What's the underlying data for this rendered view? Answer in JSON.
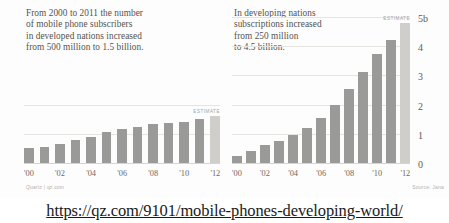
{
  "url": {
    "text": "https://qz.com/9101/mobile-phones-developing-world/"
  },
  "panels": {
    "left": {
      "blurb": "From 2000 to 2011 the number\nof mobile phone subscribers\nin developed nations increased\nfrom 500 million to 1.5 billion.",
      "estimate_label": "ESTIMATE",
      "credit": "Quartz | qz.com"
    },
    "right": {
      "blurb": "In developing nations\nsubscriptions increased\nfrom 250 million\nto 4.5 billion.",
      "estimate_label": "ESTIMATE",
      "credit": "Source: Jana"
    }
  },
  "colors": {
    "bar": "#9a9a98",
    "bar_estimate": "#cfcecb",
    "gridline": "#e6e4e1",
    "text": "#55524e"
  },
  "chart_data": [
    {
      "type": "bar",
      "title": "From 2000 to 2011 the number of mobile phone subscribers in developed nations increased from 500 million to 1.5 billion.",
      "xlabel": "",
      "ylabel": "",
      "categories": [
        "'00",
        "'01",
        "'02",
        "'03",
        "'04",
        "'05",
        "'06",
        "'07",
        "'08",
        "'09",
        "'10",
        "'11",
        "'12"
      ],
      "tick_labels": [
        "'00",
        "",
        "'02",
        "",
        "'04",
        "",
        "'06",
        "",
        "'08",
        "",
        "'10",
        "",
        "'12"
      ],
      "values": [
        0.5,
        0.55,
        0.65,
        0.8,
        0.88,
        1.05,
        1.15,
        1.25,
        1.33,
        1.38,
        1.42,
        1.5,
        1.6
      ],
      "ylim": [
        0,
        5
      ],
      "gridlines": [
        1,
        2
      ],
      "estimate_index": 12,
      "grid": true,
      "legend": "none",
      "units": "billions of subscribers"
    },
    {
      "type": "bar",
      "title": "In developing nations subscriptions increased from 250 million to 4.5 billion.",
      "xlabel": "",
      "ylabel": "",
      "categories": [
        "'00",
        "'01",
        "'02",
        "'03",
        "'04",
        "'05",
        "'06",
        "'07",
        "'08",
        "'09",
        "'10",
        "'11",
        "'12"
      ],
      "tick_labels": [
        "'00",
        "",
        "'02",
        "",
        "'04",
        "",
        "'06",
        "",
        "'08",
        "",
        "'10",
        "",
        "'12"
      ],
      "values": [
        0.25,
        0.4,
        0.6,
        0.75,
        0.95,
        1.2,
        1.55,
        2.0,
        2.55,
        3.1,
        3.75,
        4.2,
        4.8
      ],
      "ylim": [
        0,
        5
      ],
      "ytick_labels": [
        "5b",
        "4",
        "3",
        "2",
        "1",
        "0"
      ],
      "ytick_values": [
        5,
        4,
        3,
        2,
        1,
        0
      ],
      "estimate_index": 12,
      "grid": true,
      "legend": "none",
      "units": "billions of subscriptions"
    }
  ]
}
